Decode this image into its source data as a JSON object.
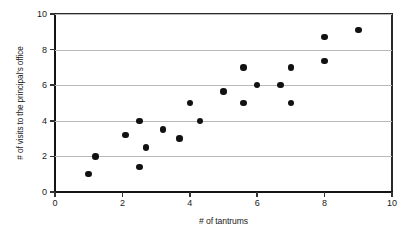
{
  "chart_data": {
    "type": "scatter",
    "title": "",
    "xlabel": "# of tantrums",
    "ylabel": "# of visits to the principal's office",
    "xlim": [
      0,
      10
    ],
    "ylim": [
      0,
      10
    ],
    "xticks": [
      "0",
      "2",
      "4",
      "6",
      "8",
      "10"
    ],
    "xtick_values": [
      0,
      2,
      4,
      6,
      8,
      10
    ],
    "yticks": [
      "0",
      "2",
      "4",
      "6",
      "8",
      "10"
    ],
    "ytick_values": [
      0,
      2,
      4,
      6,
      8,
      10
    ],
    "grid": "horizontal",
    "gridline_values": [
      2,
      4,
      6,
      8,
      10
    ],
    "legend": "none",
    "marker": "filled-circle",
    "marker_color": "#111111",
    "points": [
      {
        "x": 1.0,
        "y": 1.0
      },
      {
        "x": 1.2,
        "y": 2.0
      },
      {
        "x": 2.1,
        "y": 3.2
      },
      {
        "x": 2.5,
        "y": 4.0
      },
      {
        "x": 2.5,
        "y": 1.4
      },
      {
        "x": 2.7,
        "y": 2.5
      },
      {
        "x": 3.2,
        "y": 3.5
      },
      {
        "x": 3.7,
        "y": 3.0
      },
      {
        "x": 4.0,
        "y": 5.0
      },
      {
        "x": 4.3,
        "y": 4.0
      },
      {
        "x": 5.0,
        "y": 5.65
      },
      {
        "x": 5.6,
        "y": 7.0
      },
      {
        "x": 5.6,
        "y": 5.0
      },
      {
        "x": 6.0,
        "y": 6.0
      },
      {
        "x": 6.7,
        "y": 6.0
      },
      {
        "x": 7.0,
        "y": 7.0
      },
      {
        "x": 7.0,
        "y": 5.0
      },
      {
        "x": 8.0,
        "y": 8.7
      },
      {
        "x": 8.0,
        "y": 7.35
      },
      {
        "x": 9.0,
        "y": 9.1
      }
    ]
  },
  "colors": {
    "axis": "#141414",
    "gridline": "#b9b9b9",
    "marker": "#111111",
    "background": "#ffffff"
  }
}
